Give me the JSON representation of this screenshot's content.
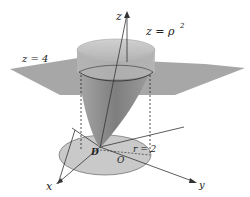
{
  "diagram": {
    "type": "3d-surface-plot",
    "labels": {
      "z_axis": "z",
      "x_axis": "x",
      "y_axis": "y",
      "surface": "z = ρ²",
      "surface_base": "z = ρ",
      "surface_exp": "2",
      "plane": "z = 4",
      "region": "D",
      "origin": "O",
      "radius": "r = 2"
    },
    "colors": {
      "plane": "#9a9a9a",
      "paraboloid": "#8c8c8c",
      "disk": "#c8c8c8",
      "axis": "#333333"
    }
  }
}
